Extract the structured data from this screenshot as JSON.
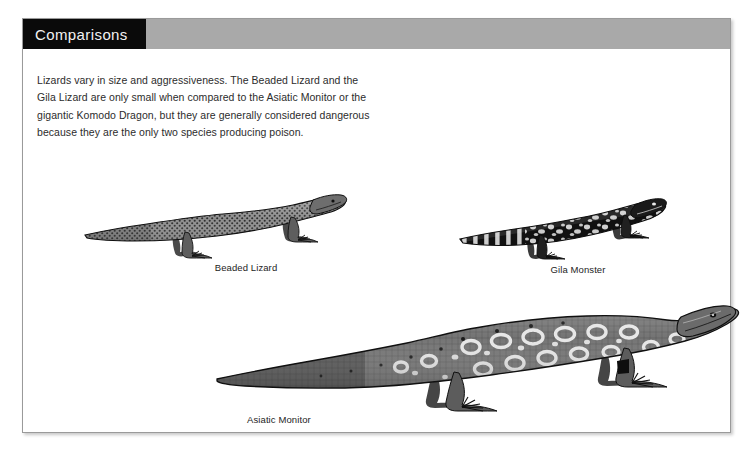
{
  "page": {
    "section_title": "Comparisons",
    "intro_paragraph": "Lizards vary in size and aggressiveness. The Beaded Lizard and the Gila Lizard are only small when compared to the Asiatic Monitor or the gigantic Komodo Dragon, but they are generally considered dangerous because they are the only two species producing poison.",
    "colors": {
      "title_block": "#0a0a0a",
      "header_bar": "#a9a9a9",
      "title_text": "#f2f2f2",
      "body_text": "#2c2c2c",
      "page_background": "#ffffff",
      "page_border": "#9a9a9a"
    }
  },
  "figures": [
    {
      "id": "beaded-lizard",
      "caption": "Beaded Lizard",
      "art_name": "beaded-lizard-illustration",
      "description": "Grayscale engraving of a beaded lizard facing right with a long tapering tail to the left and finely beaded scale texture."
    },
    {
      "id": "gila-monster",
      "caption": "Gila Monster",
      "art_name": "gila-monster-illustration",
      "description": "Grayscale engraving of a gila monster facing right with bold black and pale blotched patterning and a banded tail."
    },
    {
      "id": "asiatic-monitor",
      "caption": "Asiatic Monitor",
      "art_name": "asiatic-monitor-illustration",
      "description": "Large grayscale engraving of an asiatic monitor lizard facing right with pale ringed ocelli across the back and a very long tail extending left."
    }
  ]
}
